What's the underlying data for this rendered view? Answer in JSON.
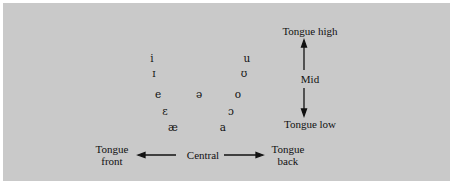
{
  "vowels": [
    {
      "symbol": "i",
      "x": 152,
      "y": 58
    },
    {
      "symbol": "ɪ",
      "x": 154,
      "y": 72
    },
    {
      "symbol": "e",
      "x": 158,
      "y": 93
    },
    {
      "symbol": "ɛ",
      "x": 165,
      "y": 111
    },
    {
      "symbol": "æ",
      "x": 173,
      "y": 127
    },
    {
      "symbol": "ə",
      "x": 199,
      "y": 93
    },
    {
      "symbol": "u",
      "x": 247,
      "y": 58
    },
    {
      "symbol": "ʊ",
      "x": 244,
      "y": 72
    },
    {
      "symbol": "o",
      "x": 238,
      "y": 93
    },
    {
      "symbol": "ɔ",
      "x": 231,
      "y": 111
    },
    {
      "symbol": "a",
      "x": 223,
      "y": 127
    }
  ],
  "labels": {
    "tongue_high": "Tongue high",
    "mid": "Mid",
    "tongue_low": "Tongue low",
    "tongue_front_1": "Tongue",
    "tongue_front_2": "front",
    "central": "Central",
    "tongue_back_1": "Tongue",
    "tongue_back_2": "back"
  },
  "colors": {
    "panel": "#c9c9c9",
    "ink": "#111111"
  }
}
